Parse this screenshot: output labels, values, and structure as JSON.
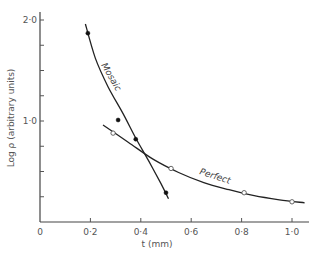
{
  "chart_data": {
    "type": "line",
    "title": "",
    "xlabel": "t (mm)",
    "ylabel": "Log ρ (arbitrary units)",
    "xlim": [
      0,
      1.05
    ],
    "ylim": [
      0,
      2.05
    ],
    "grid": false,
    "legend": "none (inline curve labels)",
    "x_ticks": [
      0,
      0.2,
      0.4,
      0.6,
      0.8,
      1.0
    ],
    "x_tick_labels": [
      "0",
      "0·2",
      "0·4",
      "0·6",
      "0·8",
      "1·0"
    ],
    "y_ticks": [
      0.25,
      0.5,
      0.75,
      1.0,
      1.25,
      1.5,
      1.75,
      2.0
    ],
    "y_tick_labels": [
      "",
      "",
      "",
      "1·0",
      "",
      "",
      "",
      "2·0"
    ],
    "series": [
      {
        "name": "Mosaic",
        "marker": "filled-circle",
        "points": [
          {
            "x": 0.19,
            "y": 1.87
          },
          {
            "x": 0.31,
            "y": 1.01
          },
          {
            "x": 0.38,
            "y": 0.82
          },
          {
            "x": 0.5,
            "y": 0.29
          }
        ],
        "curve": [
          [
            0.18,
            1.96
          ],
          [
            0.22,
            1.62
          ],
          [
            0.27,
            1.34
          ],
          [
            0.33,
            1.07
          ],
          [
            0.38,
            0.83
          ],
          [
            0.43,
            0.61
          ],
          [
            0.48,
            0.38
          ],
          [
            0.51,
            0.23
          ]
        ]
      },
      {
        "name": "Perfect",
        "marker": "open-circle",
        "points": [
          {
            "x": 0.29,
            "y": 0.88
          },
          {
            "x": 0.52,
            "y": 0.53
          },
          {
            "x": 0.81,
            "y": 0.29
          },
          {
            "x": 1.0,
            "y": 0.2
          }
        ],
        "curve": [
          [
            0.25,
            0.96
          ],
          [
            0.35,
            0.79
          ],
          [
            0.45,
            0.62
          ],
          [
            0.55,
            0.49
          ],
          [
            0.65,
            0.39
          ],
          [
            0.75,
            0.32
          ],
          [
            0.85,
            0.26
          ],
          [
            0.95,
            0.22
          ],
          [
            1.05,
            0.19
          ]
        ]
      }
    ]
  }
}
